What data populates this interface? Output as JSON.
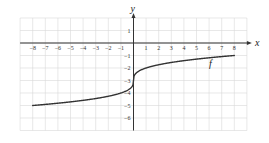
{
  "chart_data": {
    "type": "line",
    "title": "",
    "xlabel": "x",
    "ylabel": "y",
    "xlim": [
      -9,
      9
    ],
    "ylim": [
      -7,
      2
    ],
    "grid": true,
    "x_ticks": [
      -8,
      -7,
      -6,
      -5,
      -4,
      -3,
      -2,
      -1,
      1,
      2,
      3,
      4,
      5,
      6,
      7,
      8
    ],
    "y_ticks": [
      1,
      -1,
      -2,
      -3,
      -4,
      -5,
      -6
    ],
    "series": [
      {
        "name": "f",
        "label": "f",
        "x": [
          -8,
          -7,
          -6,
          -5,
          -4,
          -3,
          -2,
          -1,
          -0.5,
          -0.1,
          0,
          0.1,
          0.5,
          1,
          2,
          3,
          4,
          5,
          6,
          7,
          8
        ],
        "values": [
          -5,
          -4.91,
          -4.82,
          -4.71,
          -4.59,
          -4.44,
          -4.26,
          -4,
          -3.79,
          -3.46,
          -3,
          -2.54,
          -2.21,
          -2,
          -1.74,
          -1.56,
          -1.41,
          -1.29,
          -1.18,
          -1.09,
          -1
        ]
      }
    ],
    "annotations": [
      {
        "text": "f",
        "x": 6,
        "y": -1.6
      }
    ]
  },
  "labels": {
    "x_axis": "x",
    "y_axis": "y",
    "function": "f"
  },
  "colors": {
    "grid": "#d9d9d9",
    "axis": "#333333",
    "curve": "#333333"
  }
}
